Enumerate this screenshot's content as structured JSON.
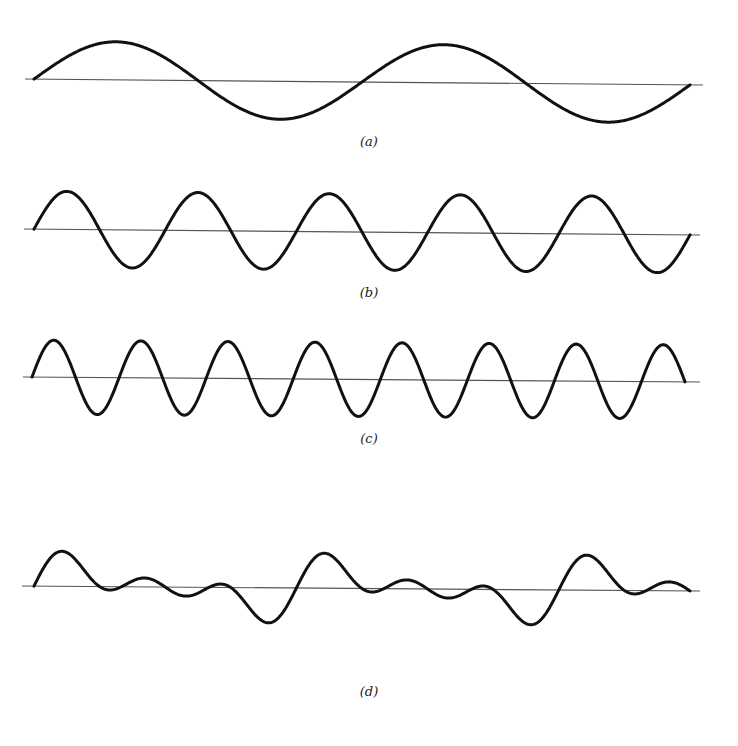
{
  "figure": {
    "background": "#ffffff",
    "stroke_color": "#111111",
    "axis_color": "#555555",
    "panels": [
      {
        "id": "a",
        "label": "(a)",
        "label_pos": [
          369,
          143
        ],
        "axis": {
          "x1": 25,
          "y1": 79,
          "x2": 703,
          "y2": 85
        },
        "wave": {
          "x_start": 34,
          "x_end": 690,
          "amplitude": 38,
          "harmonics": [
            [
              1,
              1.0,
              0
            ]
          ],
          "cycles": 2
        }
      },
      {
        "id": "b",
        "label": "(b)",
        "label_pos": [
          369,
          294
        ],
        "axis": {
          "x1": 24,
          "y1": 229,
          "x2": 700,
          "y2": 235
        },
        "wave": {
          "x_start": 34,
          "x_end": 690,
          "amplitude": 38,
          "harmonics": [
            [
              1,
              1.0,
              0
            ]
          ],
          "cycles": 5
        }
      },
      {
        "id": "c",
        "label": "(c)",
        "label_pos": [
          369,
          440
        ],
        "axis": {
          "x1": 23,
          "y1": 377,
          "x2": 700,
          "y2": 382
        },
        "wave": {
          "x_start": 32,
          "x_end": 685,
          "amplitude": 37,
          "harmonics": [
            [
              1,
              1.0,
              0
            ]
          ],
          "cycles": 7.5
        }
      },
      {
        "id": "d",
        "label": "(d)",
        "label_pos": [
          369,
          693
        ],
        "axis": {
          "x1": 22,
          "y1": 586,
          "x2": 700,
          "y2": 591
        },
        "wave": {
          "x_start": 34,
          "x_end": 690,
          "amplitude": 35,
          "harmonics": [
            [
              1,
              1.0,
              0
            ],
            [
              2,
              1.0,
              0
            ],
            [
              3,
              1.0,
              0
            ]
          ],
          "cycles": 2.5
        }
      }
    ]
  },
  "chart_data": {
    "type": "line",
    "title": "",
    "series": [
      {
        "name": "(a)",
        "cycles_shown": 2,
        "shape": "sine"
      },
      {
        "name": "(b)",
        "cycles_shown": 5,
        "shape": "sine"
      },
      {
        "name": "(c)",
        "cycles_shown": 7.5,
        "shape": "sine"
      },
      {
        "name": "(d)",
        "cycles_shown": 2.5,
        "shape": "sum of sin(θ)+sin(2θ)+sin(3θ)"
      }
    ],
    "xlabel": "",
    "ylabel": "",
    "grid": false,
    "legend": "panel labels (a)-(d) beneath each waveform"
  }
}
